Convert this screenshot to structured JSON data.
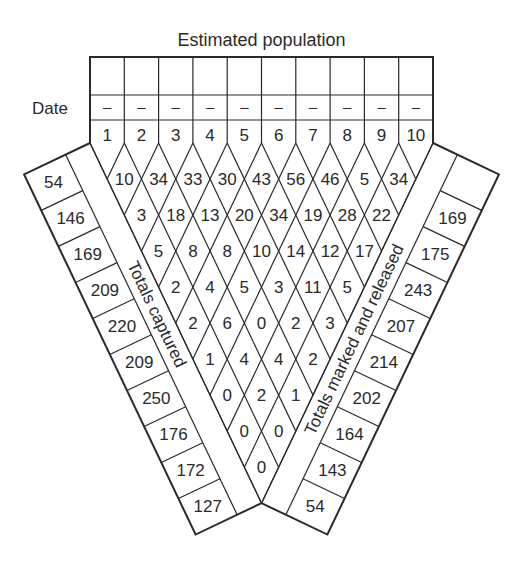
{
  "title": "Estimated population",
  "date_label": "Date",
  "colors": {
    "ink": "#2a2a2a",
    "paper": "#ffffff"
  },
  "columns": {
    "labels": [
      "1",
      "2",
      "3",
      "4",
      "5",
      "6",
      "7",
      "8",
      "9",
      "10"
    ],
    "estimated_population": [
      "",
      "",
      "",
      "",
      "",
      "",
      "",
      "",
      "",
      ""
    ],
    "dates": [
      "–",
      "–",
      "–",
      "–",
      "–",
      "–",
      "–",
      "–",
      "–",
      "–"
    ]
  },
  "recaptures": [
    [
      "10",
      "34",
      "33",
      "30",
      "43",
      "56",
      "46",
      "5",
      "34"
    ],
    [
      "3",
      "18",
      "13",
      "20",
      "34",
      "19",
      "28",
      "22"
    ],
    [
      "5",
      "8",
      "8",
      "10",
      "14",
      "12",
      "17"
    ],
    [
      "2",
      "4",
      "5",
      "3",
      "11",
      "5"
    ],
    [
      "2",
      "6",
      "0",
      "2",
      "3"
    ],
    [
      "1",
      "4",
      "4",
      "2"
    ],
    [
      "0",
      "2",
      "1"
    ],
    [
      "0",
      "0"
    ],
    [
      "0"
    ]
  ],
  "left_strip": {
    "label": "Totals captured",
    "values": [
      "54",
      "146",
      "169",
      "209",
      "220",
      "209",
      "250",
      "176",
      "172",
      "127"
    ]
  },
  "right_strip": {
    "label": "Totals marked and released",
    "values": [
      "",
      "169",
      "175",
      "243",
      "207",
      "214",
      "202",
      "164",
      "143",
      "54"
    ]
  }
}
